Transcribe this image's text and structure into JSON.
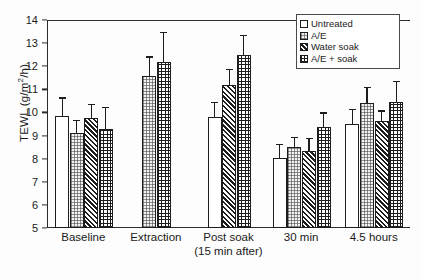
{
  "chart_data": {
    "type": "bar",
    "title": "",
    "xlabel": "",
    "ylabel": "TEWL (g/m2/h)",
    "ylabel_display": "TEWL (g/m",
    "ylabel_exp": "2",
    "ylabel_tail": "/h)",
    "ylim": [
      5,
      14
    ],
    "yticks": [
      5,
      6,
      7,
      8,
      9,
      10,
      11,
      12,
      13,
      14
    ],
    "grid": false,
    "legend_position": "top-right",
    "categories": [
      "Baseline",
      "Extraction",
      "Post soak",
      "30 min",
      "4.5 hours"
    ],
    "category_sublabels": [
      "",
      "",
      "(15 min after)",
      "",
      ""
    ],
    "series": [
      {
        "name": "Untreated",
        "pattern": "open-white",
        "values": [
          9.85,
          null,
          9.8,
          8.05,
          9.5
        ],
        "errors": [
          0.75,
          null,
          0.6,
          0.55,
          0.6
        ]
      },
      {
        "name": "A/E",
        "pattern": "light-dotted",
        "values": [
          9.12,
          11.57,
          null,
          8.5,
          10.4
        ],
        "errors": [
          0.5,
          0.8,
          null,
          0.4,
          0.65
        ]
      },
      {
        "name": "Water soak",
        "pattern": "dense-diagonal-hatch",
        "values": [
          9.78,
          null,
          11.2,
          8.35,
          9.62
        ],
        "errors": [
          0.55,
          null,
          0.65,
          0.5,
          0.42
        ]
      },
      {
        "name": "A/E + soak",
        "pattern": "crosshatch-grid",
        "values": [
          9.28,
          12.2,
          12.5,
          9.37,
          10.47
        ],
        "errors": [
          0.9,
          1.25,
          0.8,
          0.58,
          0.85
        ]
      }
    ]
  },
  "legend": {
    "items": [
      {
        "label": "Untreated"
      },
      {
        "label": "A/E"
      },
      {
        "label": "Water soak"
      },
      {
        "label": "A/E + soak"
      }
    ]
  },
  "colors": {
    "axis": "#2b2b2b",
    "bar_edge": "#1d1d1d",
    "background": "#fdfdfd"
  }
}
